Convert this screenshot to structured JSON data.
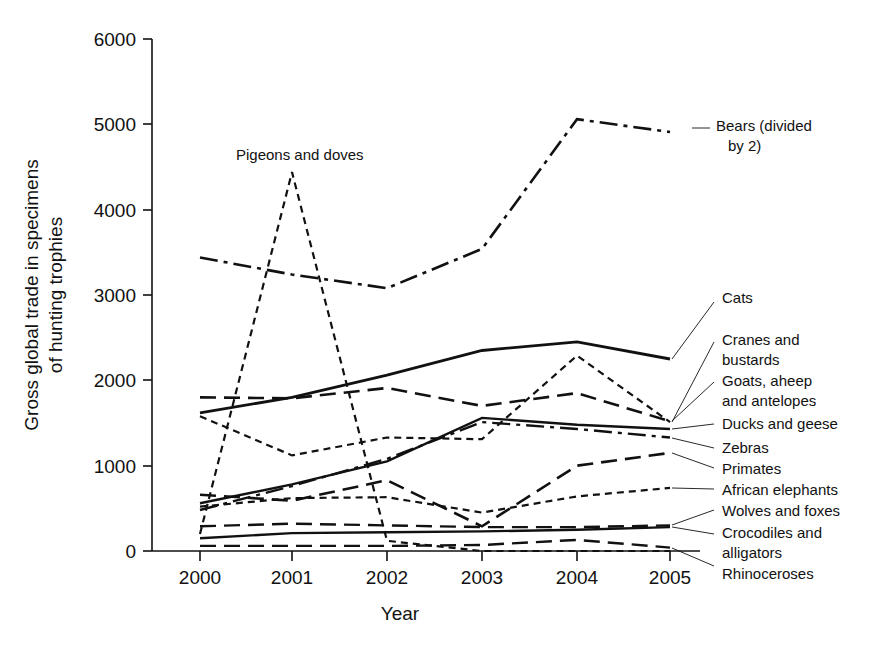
{
  "chart_data": {
    "type": "line",
    "title": "",
    "xlabel": "Year",
    "ylabel": "Gross global trade in specimens of hunting trophies",
    "categories": [
      "2000",
      "2001",
      "2002",
      "2003",
      "2004",
      "2005"
    ],
    "x": [
      2000,
      2001,
      2002,
      2003,
      2004,
      2005
    ],
    "xlim": [
      2000,
      2005
    ],
    "ylim": [
      0,
      6000
    ],
    "yticks": [
      0,
      1000,
      2000,
      3000,
      4000,
      5000,
      6000
    ],
    "ytick_labels": [
      "0",
      "1000",
      "2000",
      "3000",
      "4000",
      "5000",
      "6000"
    ],
    "grid": false,
    "legend": "inline-annotations-right",
    "series": [
      {
        "name": "Bears (divided by 2)",
        "label": "Bears (divided\nby 2)",
        "dash": "dashdot",
        "width": 2.6,
        "values": [
          3440,
          3240,
          3080,
          3540,
          5060,
          4910
        ]
      },
      {
        "name": "Pigeons and doves",
        "label": "Pigeons and doves",
        "dash": "smalldash",
        "width": 2.2,
        "values": [
          200,
          4440,
          120,
          0,
          0,
          0
        ]
      },
      {
        "name": "Cats",
        "label": "Cats",
        "dash": "solid",
        "width": 2.8,
        "values": [
          1620,
          1800,
          2060,
          2350,
          2450,
          2250
        ]
      },
      {
        "name": "Cranes and bustards",
        "label": "Cranes and\nbustards",
        "dash": "longdash",
        "width": 2.6,
        "values": [
          1800,
          1790,
          1910,
          1700,
          1850,
          1520
        ]
      },
      {
        "name": "Goats, aheep and antelopes",
        "label": "Goats, aheep\nand antelopes",
        "dash": "smalldash",
        "width": 2.2,
        "values": [
          1580,
          1120,
          1330,
          1310,
          2290,
          1510
        ]
      },
      {
        "name": "Ducks and geese",
        "label": "Ducks and geese",
        "dash": "solid",
        "width": 2.4,
        "values": [
          560,
          780,
          1050,
          1560,
          1480,
          1430
        ]
      },
      {
        "name": "Zebras",
        "label": "Zebras",
        "dash": "dashdot",
        "width": 2.4,
        "values": [
          480,
          760,
          1080,
          1510,
          1430,
          1330
        ]
      },
      {
        "name": "Primates",
        "label": "Primates",
        "dash": "longdash",
        "width": 2.6,
        "values": [
          660,
          590,
          830,
          290,
          1000,
          1150
        ]
      },
      {
        "name": "African elephants",
        "label": "African elephants",
        "dash": "smalldash",
        "width": 2.2,
        "values": [
          520,
          620,
          630,
          450,
          640,
          740
        ]
      },
      {
        "name": "Wolves and foxes",
        "label": "Wolves and foxes",
        "dash": "longdash",
        "width": 2.4,
        "values": [
          290,
          320,
          300,
          280,
          280,
          300
        ]
      },
      {
        "name": "Crocodiles and alligators",
        "label": "Crocodiles and\nalligators",
        "dash": "solid",
        "width": 2.4,
        "values": [
          150,
          210,
          220,
          230,
          250,
          280
        ]
      },
      {
        "name": "Rhinoceroses",
        "label": "Rhinoceroses",
        "dash": "longdash",
        "width": 2.4,
        "values": [
          60,
          60,
          60,
          70,
          130,
          40
        ]
      }
    ],
    "annotations": [
      {
        "id": "pigeons",
        "text": "Pigeons and doves",
        "x": 236,
        "y": 158
      },
      {
        "id": "bears",
        "text": "Bears (divided",
        "text2": "by 2)",
        "x": 717,
        "y": 132
      }
    ],
    "right_labels": [
      {
        "id": "cats",
        "lines": [
          "Cats"
        ]
      },
      {
        "id": "cranes-bustards",
        "lines": [
          "Cranes and",
          "bustards"
        ]
      },
      {
        "id": "goats-sheep-antelopes",
        "lines": [
          "Goats, aheep",
          "and antelopes"
        ]
      },
      {
        "id": "ducks-geese",
        "lines": [
          "Ducks and geese"
        ]
      },
      {
        "id": "zebras",
        "lines": [
          "Zebras"
        ]
      },
      {
        "id": "primates",
        "lines": [
          "Primates"
        ]
      },
      {
        "id": "african-elephants",
        "lines": [
          "African elephants"
        ]
      },
      {
        "id": "wolves-foxes",
        "lines": [
          "Wolves and foxes"
        ]
      },
      {
        "id": "crocodiles-alligators",
        "lines": [
          "Crocodiles and",
          "alligators"
        ]
      },
      {
        "id": "rhinoceroses",
        "lines": [
          "Rhinoceroses"
        ]
      }
    ],
    "colors": {
      "ink": "#111111",
      "background": "#ffffff"
    }
  },
  "axis": {
    "x_title": "Year",
    "y_title_line1": "Gross global trade in specimens",
    "y_title_line2": "of hunting trophies",
    "x_tick_labels": [
      "2000",
      "2001",
      "2002",
      "2003",
      "2004",
      "2005"
    ],
    "y_tick_labels": [
      "6000",
      "5000",
      "4000",
      "3000",
      "2000",
      "1000",
      "0"
    ]
  },
  "labels": {
    "pigeons_and_doves": "Pigeons and doves",
    "bears_l1": "Bears (divided",
    "bears_l2": "by 2)",
    "cats": "Cats",
    "cranes_l1": "Cranes and",
    "cranes_l2": "bustards",
    "goats_l1": "Goats, aheep",
    "goats_l2": "and antelopes",
    "ducks": "Ducks and geese",
    "zebras": "Zebras",
    "primates": "Primates",
    "african_elephants": "African elephants",
    "wolves": "Wolves and foxes",
    "crocs_l1": "Crocodiles and",
    "crocs_l2": "alligators",
    "rhinos": "Rhinoceroses"
  }
}
